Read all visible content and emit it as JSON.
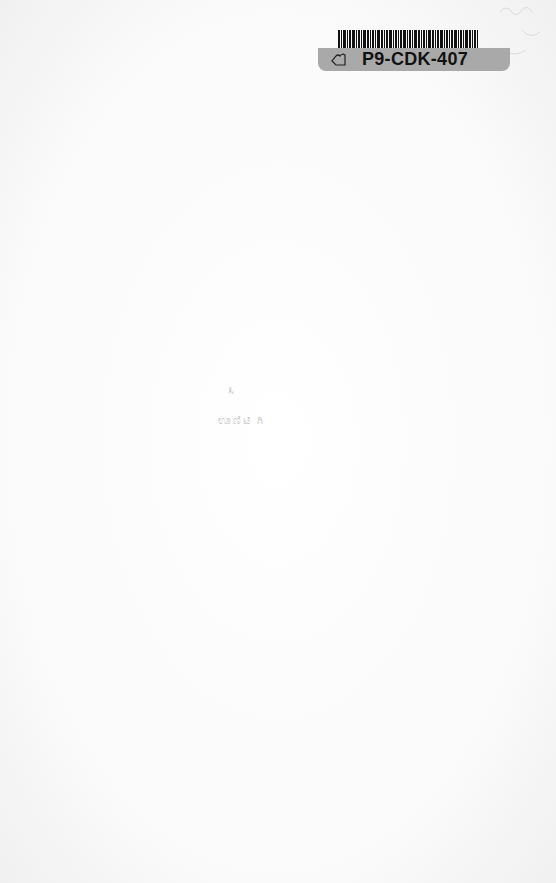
{
  "page": {
    "background": "#fbfbfb"
  },
  "library_label": {
    "call_number": "P9-CDK-407",
    "icon": "outline-leaf-icon",
    "tag_color": "#a9a9a9",
    "barcode_color": "#111111"
  },
  "bleed_through": {
    "line1": "ಸಿ",
    "line2": "ಊಣಿಟಿ ಗಿ"
  }
}
